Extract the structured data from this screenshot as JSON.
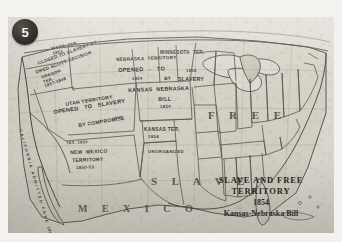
{
  "figure": {
    "badge_number": "5",
    "medium": "halftone photographic reproduction of a printed historical map"
  },
  "title_block": {
    "line1": "SLAVE AND FREE",
    "line2": "TERRITORY",
    "year": "1854",
    "subtitle": "Kansas-Nebraska Bill"
  },
  "region_words": [
    {
      "name": "free-region-word",
      "text": "F R E E",
      "left": 200,
      "top": 92,
      "size": 11
    },
    {
      "name": "slave-region-word",
      "text": "S L A V E",
      "left": 143,
      "top": 158,
      "size": 11
    },
    {
      "name": "mexico-label",
      "text": "M E X I C O",
      "left": 70,
      "top": 186,
      "size": 10
    }
  ],
  "territory_labels": [
    {
      "name": "washington-territory-label",
      "text": "WASH. TER.\n1853",
      "left": 43,
      "top": 30,
      "size": 4.2,
      "rotate": -12,
      "align": "left"
    },
    {
      "name": "oregon-closed-to-slavery-label",
      "text": "CLOSED TO SLAVERY BY",
      "left": 29,
      "top": 44,
      "size": 4.6,
      "rotate": -20,
      "align": "left"
    },
    {
      "name": "dred-scott-decision-label",
      "text": "DRED SCOTT DECISION",
      "left": 27,
      "top": 53,
      "size": 4.6,
      "rotate": -20,
      "align": "left"
    },
    {
      "name": "oregon-territory-label",
      "text": "OREGON\nTER.\n1857-1848",
      "left": 33,
      "top": 59,
      "size": 4.2,
      "rotate": -20,
      "align": "left"
    },
    {
      "name": "california-admitted-free-label",
      "text": "C A L I F O R N I A   A D M I T T E D   F R E E   1850",
      "left": 14,
      "top": 112,
      "size": 4.0,
      "rotate": 74,
      "align": "left"
    },
    {
      "name": "utah-territory-label",
      "text": "UTAH TERRITORY",
      "left": 57,
      "top": 85,
      "size": 5.0,
      "rotate": -9,
      "align": "left"
    },
    {
      "name": "utah-opened-to-slavery-label",
      "text": "OPENED   TO   SLAVERY",
      "left": 45,
      "top": 92,
      "size": 5.6,
      "rotate": -9,
      "align": "left"
    },
    {
      "name": "utah-year-label",
      "text": "1850",
      "left": 104,
      "top": 100,
      "size": 4.0,
      "rotate": -9,
      "align": "left"
    },
    {
      "name": "utah-by-compromise-label",
      "text": "BY COMPROMISE",
      "left": 70,
      "top": 106,
      "size": 5.0,
      "rotate": -9,
      "align": "left"
    },
    {
      "name": "nebraska-territory-label",
      "text": "NEBRASKA  TERRITORY",
      "left": 108,
      "top": 40,
      "size": 4.6,
      "rotate": -2,
      "align": "left"
    },
    {
      "name": "nebraska-opened-to-label",
      "text": "OPENED   -   TO",
      "left": 110,
      "top": 50,
      "size": 5.6,
      "rotate": -2,
      "align": "left"
    },
    {
      "name": "nebraska-year-label",
      "text": "1854",
      "left": 124,
      "top": 60,
      "size": 4.2,
      "rotate": -2,
      "align": "left"
    },
    {
      "name": "nebraska-by-label",
      "text": "BY",
      "left": 156,
      "top": 59,
      "size": 4.6,
      "rotate": -2,
      "align": "left"
    },
    {
      "name": "kansas-nebraska-bill-label",
      "text": "KANSAS  NEBRASKA",
      "left": 120,
      "top": 70,
      "size": 5.4,
      "rotate": -2,
      "align": "left"
    },
    {
      "name": "kansas-nebraska-bill-word",
      "text": "BILL",
      "left": 150,
      "top": 79,
      "size": 5.4,
      "rotate": -2,
      "align": "left"
    },
    {
      "name": "kansas-nebraska-bill-year",
      "text": "1854",
      "left": 152,
      "top": 88,
      "size": 4.4,
      "rotate": -2,
      "align": "left"
    },
    {
      "name": "minnesota-territory-label",
      "text": "MINNESOTA  TER.",
      "left": 152,
      "top": 33,
      "size": 4.6,
      "rotate": 0,
      "align": "left"
    },
    {
      "name": "minnesota-slavery-year-label",
      "text": "1858",
      "left": 178,
      "top": 52,
      "size": 4.2,
      "rotate": 0,
      "align": "left"
    },
    {
      "name": "minnesota-slavery-label",
      "text": "SLAVERY",
      "left": 170,
      "top": 60,
      "size": 5.2,
      "rotate": 0,
      "align": "left"
    },
    {
      "name": "kansas-territory-label",
      "text": "KANSAS TER.",
      "left": 136,
      "top": 110,
      "size": 4.8,
      "rotate": 0,
      "align": "left"
    },
    {
      "name": "kansas-territory-year-label",
      "text": "1854",
      "left": 140,
      "top": 118,
      "size": 4.4,
      "rotate": 0,
      "align": "left"
    },
    {
      "name": "unorganized-label",
      "text": "UNORGANIZED",
      "left": 140,
      "top": 133,
      "size": 4.4,
      "rotate": 0,
      "align": "left"
    },
    {
      "name": "new-mexico-territory-label",
      "text": "NEW  MEXICO",
      "left": 62,
      "top": 133,
      "size": 5.0,
      "rotate": -2,
      "align": "left"
    },
    {
      "name": "new-mexico-territory-word",
      "text": "TERRITORY",
      "left": 64,
      "top": 141,
      "size": 5.0,
      "rotate": -2,
      "align": "left"
    },
    {
      "name": "new-mexico-years-label",
      "text": "1850-53",
      "left": 68,
      "top": 149,
      "size": 4.4,
      "rotate": -2,
      "align": "left"
    },
    {
      "name": "texas-year-label",
      "text": "TEX. 1850",
      "left": 58,
      "top": 124,
      "size": 4.0,
      "rotate": -2,
      "align": "left"
    }
  ]
}
